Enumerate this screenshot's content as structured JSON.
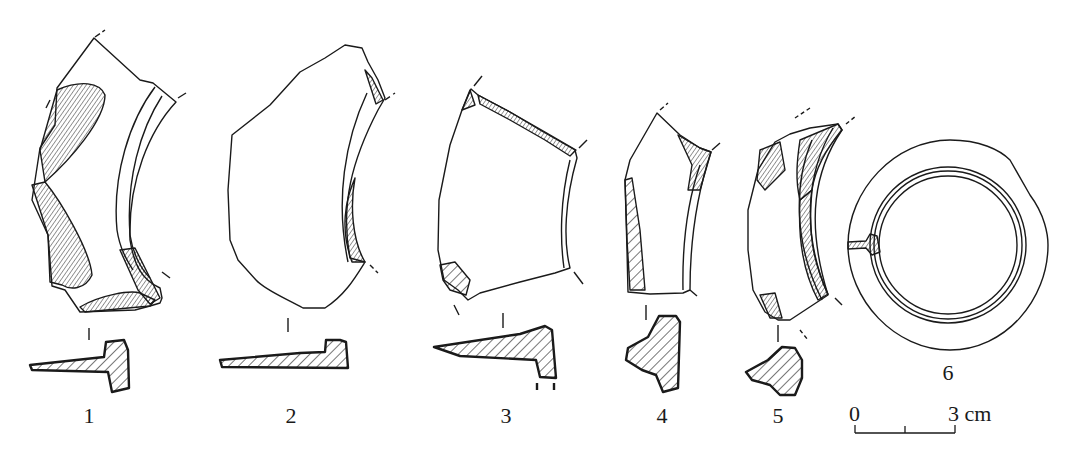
{
  "figure": {
    "ink_color": "#1a1a1a",
    "background": "#ffffff"
  },
  "specimens": [
    {
      "label": "1",
      "x": 89
    },
    {
      "label": "2",
      "x": 291
    },
    {
      "label": "3",
      "x": 506
    },
    {
      "label": "4",
      "x": 662
    },
    {
      "label": "5",
      "x": 778
    },
    {
      "label": "6",
      "x": 948
    }
  ],
  "scale_bar": {
    "start_label": "0",
    "end_label": "3 cm",
    "length_cm": 3
  }
}
